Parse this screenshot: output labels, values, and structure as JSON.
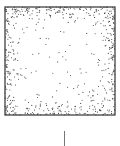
{
  "figure": {
    "type": "stippled-square",
    "square": {
      "x": 5,
      "y": 7,
      "width": 110,
      "height": 108,
      "border_color": "#333333"
    },
    "dot_color": "#444444",
    "dot_density": "dense at edges, sparse in center",
    "caption": "",
    "stem": {
      "x": 64,
      "y1": 131,
      "y2": 146,
      "color": "#777777"
    }
  }
}
